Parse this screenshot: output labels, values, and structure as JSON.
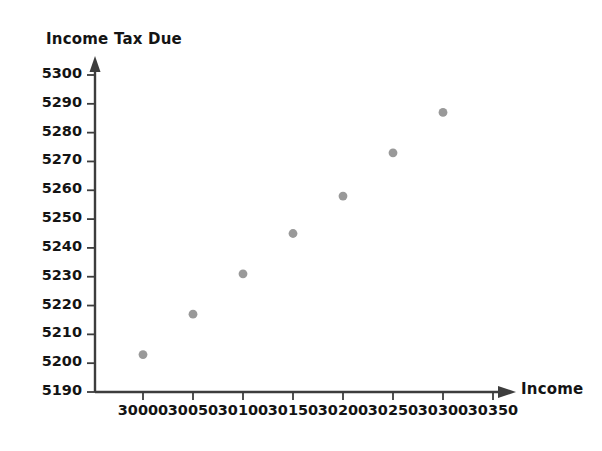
{
  "chart_data": {
    "type": "scatter",
    "title": "",
    "xlabel": "Income",
    "ylabel": "Income Tax Due",
    "xlim": [
      29975,
      30375
    ],
    "ylim": [
      5190,
      5300
    ],
    "grid": false,
    "legend": "none",
    "x_ticks": [
      "30000",
      "30050",
      "30100",
      "30150",
      "30200",
      "30250",
      "30300",
      "30350"
    ],
    "y_ticks": [
      "5190",
      "5200",
      "5210",
      "5220",
      "5230",
      "5240",
      "5250",
      "5260",
      "5270",
      "5280",
      "5290",
      "5300"
    ],
    "x": [
      30000,
      30050,
      30100,
      30150,
      30200,
      30250,
      30300
    ],
    "y": [
      5203,
      5217,
      5231,
      5245,
      5258,
      5273,
      5287
    ],
    "points": [
      {
        "x": 30000,
        "y": 5203
      },
      {
        "x": 30050,
        "y": 5217
      },
      {
        "x": 30100,
        "y": 5231
      },
      {
        "x": 30150,
        "y": 5245
      },
      {
        "x": 30200,
        "y": 5258
      },
      {
        "x": 30250,
        "y": 5273
      },
      {
        "x": 30300,
        "y": 5287
      }
    ],
    "marker_color": "#999999",
    "axis_color": "#3d3d3d",
    "background_color": "#ffffff"
  },
  "axes": {
    "x_title": "Income",
    "y_title": "Income Tax Due"
  }
}
